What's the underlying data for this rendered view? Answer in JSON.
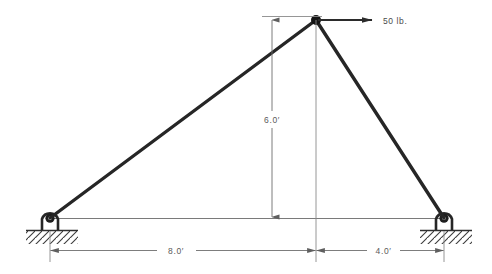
{
  "figure": {
    "kind": "statics-truss-free-body-diagram",
    "background_color": "#ffffff",
    "member_color": "#262626",
    "dimension_color": "#6e6e6e",
    "text_color": "#555555",
    "ground_color": "#3a3a3a"
  },
  "load": {
    "label": "50  lb.",
    "magnitude": "50",
    "unit": "lb.",
    "direction": "right",
    "applied_at": "apex-joint"
  },
  "dimensions": {
    "height": {
      "label": "6.0′",
      "value": "6.0",
      "unit": "′",
      "orientation": "vertical"
    },
    "left_span": {
      "label": "8.0′",
      "value": "8.0",
      "unit": "′",
      "orientation": "horizontal"
    },
    "right_span": {
      "label": "4.0′",
      "value": "4.0",
      "unit": "′",
      "orientation": "horizontal"
    }
  },
  "nodes": {
    "apex": {
      "x": 316,
      "y": 20
    },
    "left_support": {
      "x": 50,
      "y": 218
    },
    "right_support": {
      "x": 444,
      "y": 218
    }
  },
  "supports": {
    "left": {
      "type": "pin",
      "ground": "hatched"
    },
    "right": {
      "type": "pin",
      "ground": "hatched"
    }
  },
  "members": [
    {
      "name": "left-member",
      "from": "left_support",
      "to": "apex"
    },
    {
      "name": "right-member",
      "from": "apex",
      "to": "right_support"
    }
  ]
}
